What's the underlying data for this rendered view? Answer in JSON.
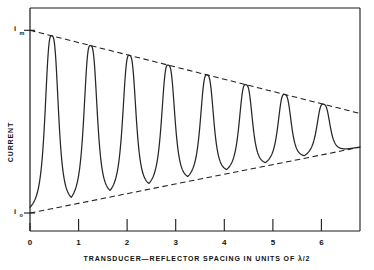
{
  "chart_data": {
    "type": "line",
    "title": "",
    "xlabel": "TRANSDUCER—REFLECTOR  SPACING  IN  UNITS  OF  λ/2",
    "ylabel": "CURRENT",
    "xlim": [
      0,
      6.8
    ],
    "ylim": [
      0,
      1
    ],
    "grid": false,
    "legend": null,
    "xticks": [
      0,
      1,
      2,
      3,
      4,
      5,
      6
    ],
    "xtick_labels": [
      "0",
      "1",
      "2",
      "3",
      "4",
      "5",
      "6"
    ],
    "ytick_labels": {
      "max": "i",
      "max_sub": "m",
      "min": "i",
      "min_sub": "o"
    },
    "series": [
      {
        "name": "current-response",
        "kind": "resonance-curve",
        "peak_x": [
          0.45,
          1.25,
          2.05,
          2.85,
          3.65,
          4.45,
          5.25,
          6.05
        ],
        "peak_y": [
          0.955,
          0.885,
          0.82,
          0.76,
          0.705,
          0.655,
          0.61,
          0.57
        ],
        "trough_x": [
          0.85,
          1.65,
          2.45,
          3.25,
          4.05,
          4.85,
          5.65
        ],
        "trough_y": [
          0.055,
          0.1,
          0.145,
          0.19,
          0.235,
          0.28,
          0.325
        ],
        "peak_width": 0.3
      },
      {
        "name": "upper-envelope",
        "kind": "dashed-envelope",
        "x": [
          0.0,
          6.8
        ],
        "y": [
          1.0,
          0.545
        ]
      },
      {
        "name": "lower-envelope",
        "kind": "dashed-envelope",
        "x": [
          0.0,
          6.8
        ],
        "y": [
          0.0,
          0.36
        ]
      }
    ],
    "annotations": [
      {
        "name": "max-current-marker",
        "text": "i_m",
        "at_x": 0,
        "at_y": 1.0
      },
      {
        "name": "min-current-marker",
        "text": "i_o",
        "at_x": 0,
        "at_y": 0.0
      }
    ]
  },
  "style": {
    "curve_color": "#262626",
    "envelope_color": "#1f1f1f",
    "frame_color": "#1a1a1a",
    "background": "#ffffff"
  }
}
